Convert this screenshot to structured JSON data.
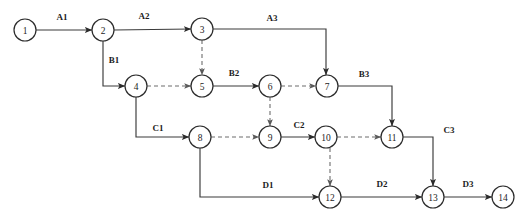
{
  "diagram": {
    "type": "activity-on-arrow-network",
    "canvas": {
      "width": 528,
      "height": 223,
      "background": "#ffffff"
    },
    "colors": {
      "node_stroke": "#2b2b2b",
      "node_fill": "#ffffff",
      "solid_edge": "#3a3a3a",
      "dashed_edge": "#6d6d6d",
      "text": "#1c1c1c"
    },
    "nodes": [
      {
        "id": "1",
        "label": "1",
        "x": 25,
        "y": 30,
        "r": 11
      },
      {
        "id": "2",
        "label": "2",
        "x": 103,
        "y": 30,
        "r": 11
      },
      {
        "id": "3",
        "label": "3",
        "x": 202,
        "y": 29,
        "r": 11
      },
      {
        "id": "4",
        "label": "4",
        "x": 136,
        "y": 86,
        "r": 11
      },
      {
        "id": "5",
        "label": "5",
        "x": 202,
        "y": 86,
        "r": 11
      },
      {
        "id": "6",
        "label": "6",
        "x": 270,
        "y": 86,
        "r": 11
      },
      {
        "id": "7",
        "label": "7",
        "x": 327,
        "y": 86,
        "r": 11
      },
      {
        "id": "8",
        "label": "8",
        "x": 200,
        "y": 137,
        "r": 11
      },
      {
        "id": "9",
        "label": "9",
        "x": 270,
        "y": 137,
        "r": 11
      },
      {
        "id": "10",
        "label": "10",
        "x": 326,
        "y": 137,
        "r": 11
      },
      {
        "id": "11",
        "label": "11",
        "x": 392,
        "y": 137,
        "r": 11
      },
      {
        "id": "12",
        "label": "12",
        "x": 330,
        "y": 197,
        "r": 11
      },
      {
        "id": "13",
        "label": "13",
        "x": 433,
        "y": 197,
        "r": 11
      },
      {
        "id": "14",
        "label": "14",
        "x": 503,
        "y": 197,
        "r": 11
      }
    ],
    "edges": [
      {
        "id": "A1",
        "label": "A1",
        "from": "1",
        "to": "2",
        "style": "solid",
        "path": "M 36,30 L 92,30",
        "label_x": 62,
        "label_y": 20
      },
      {
        "id": "A2",
        "label": "A2",
        "from": "2",
        "to": "3",
        "style": "solid",
        "path": "M 114,30 L 191,29",
        "label_x": 144,
        "label_y": 19
      },
      {
        "id": "A3",
        "label": "A3",
        "from": "3",
        "to": "7",
        "style": "solid",
        "path": "M 213,29 L 326,29 L 326,75",
        "label_x": 272,
        "label_y": 21
      },
      {
        "id": "B1",
        "label": "B1",
        "from": "2",
        "to": "4",
        "style": "solid",
        "path": "M 103,41 L 103,86 L 125,86",
        "label_x": 114,
        "label_y": 63
      },
      {
        "id": "B2",
        "label": "B2",
        "from": "5",
        "to": "6",
        "style": "solid",
        "path": "M 213,86 L 259,86",
        "label_x": 234,
        "label_y": 76
      },
      {
        "id": "B3",
        "label": "B3",
        "from": "7",
        "to": "11",
        "style": "solid",
        "path": "M 338,86 L 392,86 L 392,126",
        "label_x": 364,
        "label_y": 77
      },
      {
        "id": "C1",
        "label": "C1",
        "from": "4",
        "to": "8",
        "style": "solid",
        "path": "M 136,97 L 136,137 L 189,137",
        "label_x": 158,
        "label_y": 131
      },
      {
        "id": "C2",
        "label": "C2",
        "from": "9",
        "to": "10",
        "style": "solid",
        "path": "M 281,137 L 315,137",
        "label_x": 299,
        "label_y": 128
      },
      {
        "id": "C3",
        "label": "C3",
        "from": "11",
        "to": "13",
        "style": "solid",
        "path": "M 403,137 L 433,137 L 433,186",
        "label_x": 449,
        "label_y": 133
      },
      {
        "id": "D1",
        "label": "D1",
        "from": "8",
        "to": "12",
        "style": "solid",
        "path": "M 200,148 L 200,197 L 319,197",
        "label_x": 268,
        "label_y": 188
      },
      {
        "id": "D2",
        "label": "D2",
        "from": "12",
        "to": "13",
        "style": "solid",
        "path": "M 341,197 L 422,197",
        "label_x": 382,
        "label_y": 187
      },
      {
        "id": "D3",
        "label": "D3",
        "from": "13",
        "to": "14",
        "style": "solid",
        "path": "M 444,197 L 492,197",
        "label_x": 468,
        "label_y": 187
      },
      {
        "id": "dummy-4-5",
        "label": "",
        "from": "4",
        "to": "5",
        "style": "dashed",
        "path": "M 147,86 L 191,86"
      },
      {
        "id": "dummy-3-5",
        "label": "",
        "from": "3",
        "to": "5",
        "style": "dashed",
        "path": "M 202,40 L 202,75"
      },
      {
        "id": "dummy-6-7",
        "label": "",
        "from": "6",
        "to": "7",
        "style": "dashed",
        "path": "M 281,86 L 316,86"
      },
      {
        "id": "dummy-8-9",
        "label": "",
        "from": "8",
        "to": "9",
        "style": "dashed",
        "path": "M 211,137 L 259,137"
      },
      {
        "id": "dummy-6-9",
        "label": "",
        "from": "6",
        "to": "9",
        "style": "dashed",
        "path": "M 270,97 L 270,126"
      },
      {
        "id": "dummy-10-11",
        "label": "",
        "from": "10",
        "to": "11",
        "style": "dashed",
        "path": "M 337,137 L 381,137"
      },
      {
        "id": "dummy-10-12",
        "label": "",
        "from": "10",
        "to": "12",
        "style": "dashed",
        "path": "M 330,148 L 330,186"
      }
    ]
  }
}
